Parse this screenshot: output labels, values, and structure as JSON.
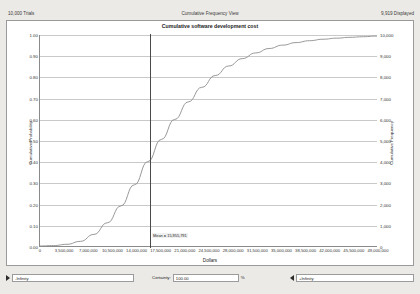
{
  "header": {
    "trials": "10,000 Trials",
    "view_title": "Cumulative Frequency View",
    "displayed": "9,919 Displayed"
  },
  "chart_data": {
    "type": "line",
    "title": "Cumulative software development cost",
    "xlabel": "Dollars",
    "ylabel_left": "Cumulative Probability",
    "ylabel_right": "Cumulative Frequency",
    "xlim": [
      0,
      49000000
    ],
    "ylim_left": [
      0.0,
      1.0
    ],
    "ylim_right": [
      0,
      10000
    ],
    "grid": true,
    "x_ticks": [
      "0",
      "3,500,000",
      "7,000,000",
      "10,500,000",
      "14,000,000",
      "17,500,000",
      "21,000,000",
      "24,500,000",
      "28,000,000",
      "31,500,000",
      "35,000,000",
      "38,500,000",
      "42,000,000",
      "45,500,000",
      "49,000,000"
    ],
    "y_ticks_left": [
      "1.00",
      "0.90",
      "0.80",
      "0.70",
      "0.60",
      "0.50",
      "0.40",
      "0.30",
      "0.20",
      "0.10",
      "0.00"
    ],
    "y_ticks_right": [
      "10,000",
      "9,000",
      "8,000",
      "7,000",
      "6,000",
      "5,000",
      "4,000",
      "3,000",
      "2,000",
      "1,000",
      "0"
    ],
    "series": [
      {
        "name": "Cumulative probability",
        "x": [
          0,
          1960000,
          3920000,
          5880000,
          7840000,
          9800000,
          11760000,
          13720000,
          15680000,
          17640000,
          19600000,
          21560000,
          23520000,
          25480000,
          27440000,
          29400000,
          31360000,
          33320000,
          35280000,
          37240000,
          39200000,
          41160000,
          43120000,
          45080000,
          47040000,
          49000000
        ],
        "values": [
          0.0,
          0.002,
          0.008,
          0.022,
          0.055,
          0.11,
          0.19,
          0.29,
          0.4,
          0.505,
          0.6,
          0.683,
          0.752,
          0.808,
          0.853,
          0.888,
          0.915,
          0.936,
          0.952,
          0.964,
          0.973,
          0.98,
          0.985,
          0.989,
          0.992,
          0.995
        ]
      }
    ],
    "annotations": [
      {
        "name": "mean-line",
        "label": "Mean = 15,955,791",
        "x_value": 15955791,
        "probability": 0.41
      }
    ]
  },
  "certainty_bar": {
    "lower_value": "-Infinity",
    "certainty_label": "Certainty:",
    "certainty_value": "100.00",
    "percent_symbol": "%",
    "upper_value": "+Infinity"
  }
}
